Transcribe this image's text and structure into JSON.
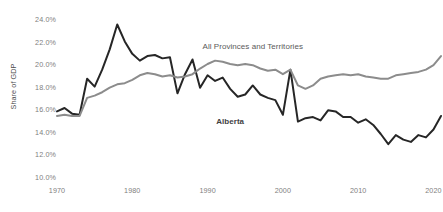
{
  "chart_data": {
    "type": "line",
    "title": "",
    "subtitle": "",
    "xlabel": "",
    "ylabel": "Share of GDP",
    "xlim": [
      1970,
      2021
    ],
    "ylim": [
      10.0,
      24.0
    ],
    "grid": false,
    "legend_position": "inline-annotation",
    "y_tick_labels": [
      "24.0%",
      "22.0%",
      "20.0%",
      "18.0%",
      "16.0%",
      "14.0%",
      "12.0%",
      "10.0%"
    ],
    "y_tick_values": [
      24.0,
      22.0,
      20.0,
      18.0,
      16.0,
      14.0,
      12.0,
      10.0
    ],
    "x_tick_labels": [
      "1970",
      "1980",
      "1990",
      "2000",
      "2010",
      "2020"
    ],
    "x_tick_values": [
      1970,
      1980,
      1990,
      2000,
      2010,
      2020
    ],
    "x": [
      1970,
      1971,
      1972,
      1973,
      1974,
      1975,
      1976,
      1977,
      1978,
      1979,
      1980,
      1981,
      1982,
      1983,
      1984,
      1985,
      1986,
      1987,
      1988,
      1989,
      1990,
      1991,
      1992,
      1993,
      1994,
      1995,
      1996,
      1997,
      1998,
      1999,
      2000,
      2001,
      2002,
      2003,
      2004,
      2005,
      2006,
      2007,
      2008,
      2009,
      2010,
      2011,
      2012,
      2013,
      2014,
      2015,
      2016,
      2017,
      2018,
      2019,
      2020,
      2021
    ],
    "series": [
      {
        "name": "Alberta",
        "color": "#262626",
        "values": [
          15.9,
          16.2,
          15.7,
          15.6,
          18.8,
          18.1,
          19.6,
          21.4,
          23.6,
          22.1,
          21.0,
          20.4,
          20.8,
          20.9,
          20.6,
          20.7,
          17.5,
          19.2,
          20.5,
          18.0,
          19.1,
          18.6,
          18.9,
          17.9,
          17.2,
          17.4,
          18.2,
          17.4,
          17.1,
          16.9,
          15.6,
          19.6,
          15.0,
          15.3,
          15.4,
          15.1,
          16.0,
          15.9,
          15.4,
          15.4,
          14.9,
          15.2,
          14.7,
          13.9,
          13.0,
          13.8,
          13.4,
          13.2,
          13.8,
          13.6,
          14.3,
          15.5
        ]
      },
      {
        "name": "All Provinces and Territories",
        "color": "#8c8c8c",
        "values": [
          15.5,
          15.6,
          15.5,
          15.5,
          17.1,
          17.3,
          17.6,
          18.0,
          18.3,
          18.4,
          18.7,
          19.1,
          19.3,
          19.2,
          19.0,
          19.1,
          18.9,
          19.0,
          19.2,
          19.7,
          20.1,
          20.4,
          20.3,
          20.1,
          20.0,
          20.1,
          20.0,
          19.7,
          19.5,
          19.6,
          19.2,
          19.6,
          18.2,
          17.9,
          18.2,
          18.8,
          19.0,
          19.1,
          19.2,
          19.1,
          19.2,
          19.0,
          18.9,
          18.8,
          18.8,
          19.1,
          19.2,
          19.3,
          19.4,
          19.6,
          20.0,
          20.8
        ]
      }
    ],
    "annotations": [
      {
        "text": "All Provinces and Territories",
        "x": 1996,
        "y": 21.6,
        "bold": false
      },
      {
        "text": "Alberta",
        "x": 1993,
        "y": 15.0,
        "bold": true
      }
    ]
  },
  "axis": {
    "y_title": "Share of GDP"
  }
}
